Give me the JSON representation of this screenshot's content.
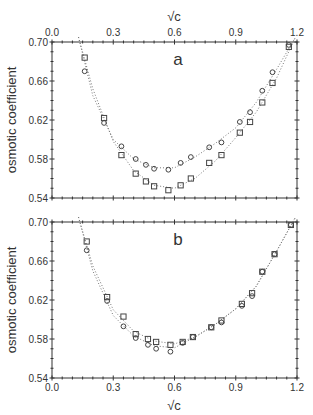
{
  "chart_data": [
    {
      "type": "scatter",
      "panel_label": "a",
      "xlabel": "√c",
      "ylabel": "osmotic coefficient",
      "xlim": [
        0.0,
        1.2
      ],
      "ylim": [
        0.54,
        0.7
      ],
      "xticks": [
        "0.0",
        "0.3",
        "0.6",
        "0.9",
        "1.2"
      ],
      "yticks": [
        "0.54",
        "0.58",
        "0.62",
        "0.66",
        "0.70"
      ],
      "x_axis_position": "top",
      "grid": false,
      "series": [
        {
          "name": "circles",
          "marker": "circle",
          "x": [
            0.16,
            0.255,
            0.34,
            0.41,
            0.46,
            0.5,
            0.57,
            0.63,
            0.68,
            0.77,
            0.83,
            0.92,
            0.97,
            1.03,
            1.08,
            1.16
          ],
          "y": [
            0.67,
            0.617,
            0.593,
            0.58,
            0.574,
            0.57,
            0.569,
            0.576,
            0.582,
            0.592,
            0.597,
            0.618,
            0.628,
            0.65,
            0.669,
            0.697
          ]
        },
        {
          "name": "squares",
          "marker": "square",
          "x": [
            0.16,
            0.255,
            0.34,
            0.41,
            0.46,
            0.5,
            0.57,
            0.63,
            0.68,
            0.77,
            0.83,
            0.92,
            0.97,
            1.03,
            1.08,
            1.16
          ],
          "y": [
            0.684,
            0.622,
            0.584,
            0.565,
            0.557,
            0.552,
            0.548,
            0.553,
            0.56,
            0.576,
            0.584,
            0.607,
            0.618,
            0.638,
            0.658,
            0.695
          ]
        }
      ],
      "fit_curves": [
        {
          "name": "circles-fit",
          "x": [
            0.13,
            0.2,
            0.3,
            0.4,
            0.5,
            0.6,
            0.7,
            0.8,
            0.9,
            1.0,
            1.1,
            1.19
          ],
          "y": [
            0.705,
            0.645,
            0.6,
            0.58,
            0.571,
            0.571,
            0.582,
            0.596,
            0.612,
            0.638,
            0.672,
            0.704
          ]
        },
        {
          "name": "squares-fit",
          "x": [
            0.13,
            0.2,
            0.3,
            0.4,
            0.5,
            0.6,
            0.7,
            0.8,
            0.9,
            1.0,
            1.1,
            1.19
          ],
          "y": [
            0.705,
            0.652,
            0.598,
            0.568,
            0.553,
            0.55,
            0.56,
            0.578,
            0.602,
            0.628,
            0.663,
            0.704
          ]
        }
      ]
    },
    {
      "type": "scatter",
      "panel_label": "b",
      "xlabel": "√c",
      "ylabel": "osmotic coefficient",
      "xlim": [
        0.0,
        1.2
      ],
      "ylim": [
        0.54,
        0.7
      ],
      "xticks": [
        "0.0",
        "0.3",
        "0.6",
        "0.9",
        "1.2"
      ],
      "yticks": [
        "0.54",
        "0.58",
        "0.62",
        "0.66",
        "0.70"
      ],
      "x_axis_position": "bottom",
      "grid": false,
      "series": [
        {
          "name": "circles",
          "marker": "circle",
          "x": [
            0.17,
            0.27,
            0.35,
            0.41,
            0.47,
            0.51,
            0.58,
            0.64,
            0.69,
            0.78,
            0.83,
            0.93,
            0.98,
            1.03,
            1.09,
            1.17
          ],
          "y": [
            0.671,
            0.619,
            0.593,
            0.581,
            0.574,
            0.57,
            0.567,
            0.576,
            0.582,
            0.592,
            0.597,
            0.614,
            0.624,
            0.649,
            0.667,
            0.697
          ]
        },
        {
          "name": "squares",
          "marker": "square",
          "x": [
            0.17,
            0.27,
            0.35,
            0.41,
            0.47,
            0.51,
            0.58,
            0.64,
            0.69,
            0.78,
            0.83,
            0.93,
            0.98,
            1.03,
            1.09,
            1.17
          ],
          "y": [
            0.68,
            0.623,
            0.603,
            0.585,
            0.58,
            0.577,
            0.574,
            0.577,
            0.582,
            0.592,
            0.599,
            0.616,
            0.627,
            0.649,
            0.667,
            0.697
          ]
        }
      ],
      "fit_curves": [
        {
          "name": "circles-fit",
          "x": [
            0.13,
            0.2,
            0.3,
            0.4,
            0.5,
            0.6,
            0.7,
            0.8,
            0.9,
            1.0,
            1.1,
            1.19
          ],
          "y": [
            0.705,
            0.65,
            0.604,
            0.583,
            0.573,
            0.571,
            0.582,
            0.595,
            0.611,
            0.634,
            0.67,
            0.704
          ]
        },
        {
          "name": "squares-fit",
          "x": [
            0.13,
            0.2,
            0.3,
            0.4,
            0.5,
            0.6,
            0.7,
            0.8,
            0.9,
            1.0,
            1.1,
            1.19
          ],
          "y": [
            0.705,
            0.655,
            0.61,
            0.588,
            0.578,
            0.575,
            0.582,
            0.595,
            0.611,
            0.634,
            0.67,
            0.704
          ]
        }
      ]
    }
  ],
  "figure": {
    "top_axis_title": "√c",
    "bottom_axis_title": "√c",
    "ylabel_top": "osmotic coefficient",
    "ylabel_bottom": "osmotic coefficient",
    "colors": {
      "axis": "#333333",
      "marker": "#444444",
      "fit": "#777777"
    }
  }
}
